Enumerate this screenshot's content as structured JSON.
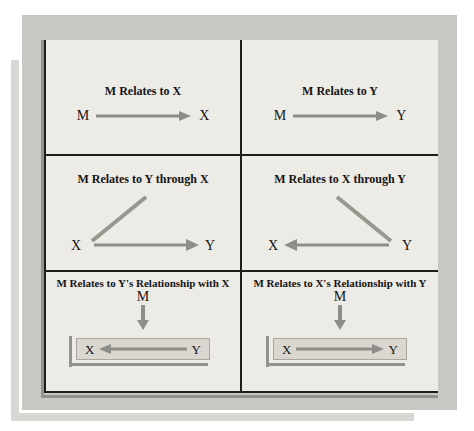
{
  "panels": {
    "top_left": {
      "title": "M Relates to X",
      "node_from": "M",
      "node_to": "X"
    },
    "top_right": {
      "title": "M Relates to Y",
      "node_from": "M",
      "node_to": "Y"
    },
    "mid_left": {
      "title": "M Relates to Y through X",
      "node_left": "X",
      "node_right": "Y"
    },
    "mid_right": {
      "title": "M Relates to X through Y",
      "node_left": "X",
      "node_right": "Y"
    },
    "bottom_left": {
      "title": "M Relates to Y's Relationship with X",
      "moderator": "M",
      "node_left": "X",
      "node_right": "Y"
    },
    "bottom_right": {
      "title": "M Relates to X's Relationship with Y",
      "moderator": "M",
      "node_left": "X",
      "node_right": "Y"
    }
  },
  "colors": {
    "page_background": "#ffffff",
    "panel_frame": "#c9c7c1",
    "table_background": "#edebe6",
    "page_shadow": "#d8d7d3",
    "line_shadow_gray": "#93928b",
    "arrow_gray": "#8e8d87",
    "diagonal_gray": "#98978f",
    "highlight_box_fill": "#d9d7cf",
    "border_black": "#1d1d1b"
  }
}
